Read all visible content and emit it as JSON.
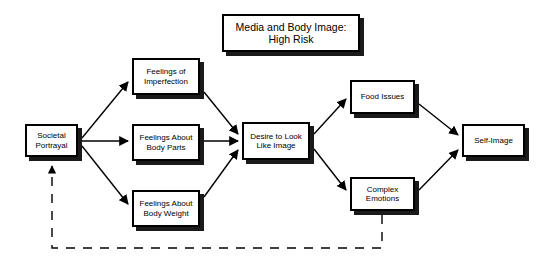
{
  "diagram": {
    "type": "flowchart",
    "title": "Media and Body Image:\nHigh Risk",
    "background_color": "#ffffff",
    "line_color": "#000000",
    "box_fill_color": "#ffffff",
    "shadow_color": "#1a1a1a",
    "nodes": [
      {
        "id": "title",
        "label": "Media and Body Image:\nHigh Risk"
      },
      {
        "id": "societal",
        "label": "Societal\nPortrayal"
      },
      {
        "id": "imperfect",
        "label": "Feelings of\nImperfection"
      },
      {
        "id": "bodyparts",
        "label": "Feelings About\nBody Parts"
      },
      {
        "id": "bodyweight",
        "label": "Feelings About\nBody Weight"
      },
      {
        "id": "desire",
        "label": "Desire to Look\nLike Image"
      },
      {
        "id": "food",
        "label": "Food Issues"
      },
      {
        "id": "complex",
        "label": "Complex\nEmotions"
      },
      {
        "id": "selfimage",
        "label": "Self-Image"
      }
    ],
    "edges": [
      {
        "from": "societal",
        "to": "imperfect",
        "style": "solid"
      },
      {
        "from": "societal",
        "to": "bodyparts",
        "style": "solid"
      },
      {
        "from": "societal",
        "to": "bodyweight",
        "style": "solid"
      },
      {
        "from": "imperfect",
        "to": "desire",
        "style": "solid"
      },
      {
        "from": "bodyparts",
        "to": "desire",
        "style": "solid"
      },
      {
        "from": "bodyweight",
        "to": "desire",
        "style": "solid"
      },
      {
        "from": "desire",
        "to": "food",
        "style": "solid"
      },
      {
        "from": "desire",
        "to": "complex",
        "style": "solid"
      },
      {
        "from": "food",
        "to": "selfimage",
        "style": "solid"
      },
      {
        "from": "complex",
        "to": "selfimage",
        "style": "solid"
      },
      {
        "from": "complex",
        "to": "societal",
        "style": "dashed"
      }
    ]
  }
}
